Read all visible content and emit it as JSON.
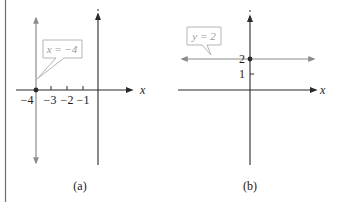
{
  "figure": {
    "panels": [
      {
        "id": "a",
        "caption": "(a)",
        "axis_label_x": "x",
        "callout": "x = −4",
        "tick_labels": [
          "−4",
          "−3",
          "−2",
          "−1"
        ],
        "line": {
          "type": "vertical",
          "equation": "x = -4",
          "x": -4
        },
        "highlight_point": {
          "x": -4,
          "y": 0
        }
      },
      {
        "id": "b",
        "caption": "(b)",
        "axis_label_x": "x",
        "callout": "y = 2",
        "tick_labels": [
          "2",
          "1"
        ],
        "line": {
          "type": "horizontal",
          "equation": "y = 2",
          "y": 2
        },
        "highlight_point": {
          "x": 0,
          "y": 2
        }
      }
    ],
    "colors": {
      "axis": "#2a2a2a",
      "graph_line": "#8c8c8c",
      "callout_border": "#b5b5b5",
      "callout_text": "#9a9a9a"
    }
  }
}
